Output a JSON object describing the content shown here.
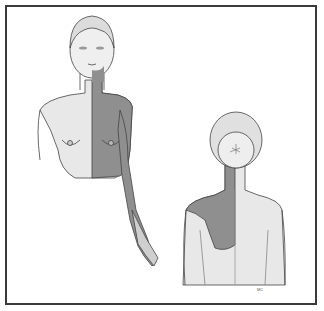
{
  "figure": {
    "colors": {
      "skin": "#e8e8e8",
      "shaded_region": "#8f8f8f",
      "outline": "#444444",
      "frame": "#3a3a3a"
    },
    "views": [
      {
        "label": "front-view",
        "shaded": [
          "left neck",
          "left chest",
          "left arm (ulnar side)"
        ]
      },
      {
        "label": "back-view",
        "shaded": [
          "left neck",
          "left upper back / scapular region"
        ]
      }
    ],
    "signature": "MC"
  }
}
